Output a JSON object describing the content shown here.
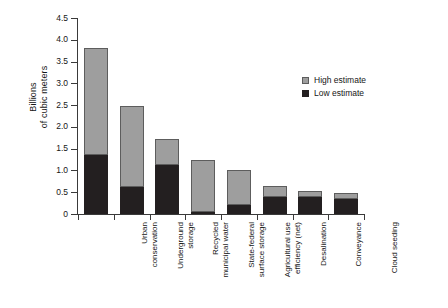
{
  "chart_data": {
    "type": "bar",
    "subtype": "stacked-bar",
    "title": "",
    "xlabel": "",
    "ylabel": "Billions\nof cubic meters",
    "ylim": [
      0,
      4.5
    ],
    "ytick_labels": [
      "0",
      "0.5",
      "1.0",
      "1.5",
      "2.0",
      "2.5",
      "3.0",
      "3.5",
      "4.0",
      "4.5"
    ],
    "ytick_values": [
      0,
      0.5,
      1.0,
      1.5,
      2.0,
      2.5,
      3.0,
      3.5,
      4.0,
      4.5
    ],
    "grid": false,
    "legend_position": "upper right",
    "categories": [
      "Urban\nconservation",
      "Underground\nstorage",
      "Recycled\nmunicipal water",
      "State-federal\nsurface storage",
      "Agricultural use\nefficiency (net)",
      "Desalination",
      "Conveyance",
      "Cloud  seeding"
    ],
    "series": [
      {
        "name": "Low estimate",
        "color": "#231f20",
        "values": [
          1.35,
          0.62,
          1.12,
          0.05,
          0.2,
          0.4,
          0.38,
          0.35
        ]
      },
      {
        "name": "High estimate",
        "color": "#9e9e9e",
        "values": [
          3.82,
          2.47,
          1.73,
          1.24,
          1.02,
          0.64,
          0.52,
          0.49
        ]
      }
    ],
    "legend": [
      {
        "label": "High estimate",
        "color": "#9e9e9e",
        "swatch": "high"
      },
      {
        "label": "Low estimate",
        "color": "#231f20",
        "swatch": "low"
      }
    ]
  }
}
